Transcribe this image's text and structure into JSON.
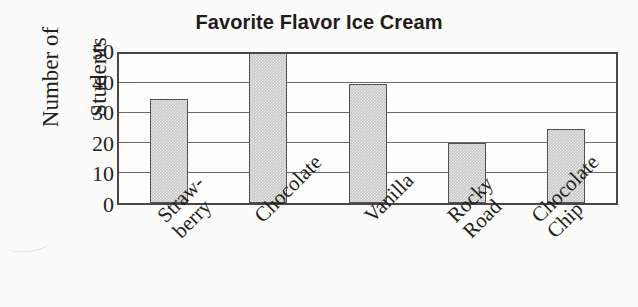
{
  "chart_data": {
    "type": "bar",
    "title": "Favorite Flavor Ice Cream",
    "xlabel": "",
    "ylabel": "Number of Students",
    "ylabel_lines": [
      "Number of",
      "Students"
    ],
    "categories": [
      "Straw-berry",
      "Chocolate",
      "Vanilla",
      "Rocky Road",
      "Chocolate Chip"
    ],
    "category_lines": [
      [
        "Straw-",
        "berry"
      ],
      [
        "Chocolate"
      ],
      [
        "Vanilla"
      ],
      [
        "Rocky",
        "Road"
      ],
      [
        "Chocolate",
        "Chip"
      ]
    ],
    "values": [
      35,
      50,
      40,
      20,
      25
    ],
    "ylim": [
      0,
      50
    ],
    "yticks": [
      0,
      10,
      20,
      30,
      40,
      50
    ],
    "grid": true,
    "legend": false,
    "bar_fill_color": "#c9c9c7",
    "bar_edge_color": "#55504f",
    "axis_color": "#4a4648",
    "background_color": "#fbfbfa",
    "text_color": "#231f20"
  }
}
